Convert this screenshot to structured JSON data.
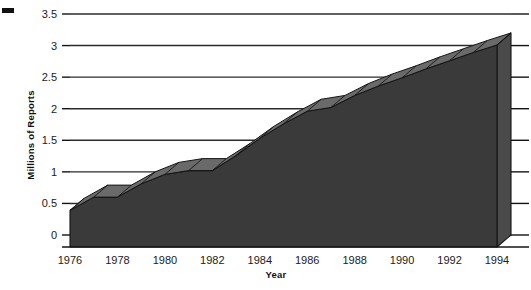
{
  "chart_data": {
    "type": "area",
    "title": "",
    "xlabel": "Year",
    "ylabel": "Millions of Reports",
    "x": [
      1976,
      1977,
      1978,
      1979,
      1980,
      1981,
      1982,
      1983,
      1984,
      1985,
      1986,
      1987,
      1988,
      1989,
      1990,
      1991,
      1992,
      1993,
      1994
    ],
    "values": [
      0.58,
      0.79,
      0.79,
      1.0,
      1.15,
      1.21,
      1.21,
      1.45,
      1.72,
      1.95,
      2.15,
      2.21,
      2.4,
      2.55,
      2.68,
      2.82,
      2.95,
      3.08,
      3.2
    ],
    "xlim": [
      1976,
      1994
    ],
    "ylim": [
      0,
      3.5
    ],
    "xticks": [
      1976,
      1978,
      1980,
      1982,
      1984,
      1986,
      1988,
      1990,
      1992,
      1994
    ],
    "xtick_labels": [
      "1976",
      "1978",
      "1980",
      "1982",
      "1984",
      "1986",
      "1988",
      "1990",
      "1992",
      "1994"
    ],
    "yticks": [
      0,
      0.5,
      1,
      1.5,
      2,
      2.5,
      3,
      3.5
    ],
    "ytick_labels": [
      "0",
      "0.5",
      "1",
      "1.5",
      "2",
      "2.5",
      "3",
      "3.5"
    ],
    "grid": true,
    "grid_orientation": "horizontal",
    "legend": null,
    "style": "3d-area",
    "colors": {
      "area_fill": "#3a3a3a",
      "ribbon_top": "#6a6a6a",
      "depth_face": "#4a4a4a",
      "outline": "#141414",
      "gridline": "#2b2b2b",
      "text": "#1a1a1a",
      "background": "#ffffff"
    }
  },
  "figure": {
    "corner_mark_name": "crop-mark"
  }
}
